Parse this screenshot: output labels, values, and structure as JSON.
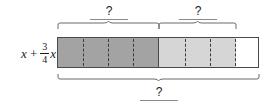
{
  "figure": {
    "type": "bar-model-diagram",
    "expression": {
      "term1": "x",
      "operator": "+",
      "fraction_numerator": "3",
      "fraction_denominator": "4",
      "term2": "x"
    },
    "labels": {
      "top_left_question": "?",
      "top_right_question": "?",
      "bottom_question": "?"
    },
    "colors": {
      "dark_segment": "#a3a3a3",
      "light_segment": "#d6d6d6",
      "empty_segment": "#ffffff",
      "outline": "#4a4a4a",
      "brace": "#6b6b6b",
      "blank_line": "#8a8a8a"
    },
    "segments": {
      "dark_units": "4",
      "light_units": "3",
      "empty_units": "1",
      "total_units": "8"
    }
  }
}
